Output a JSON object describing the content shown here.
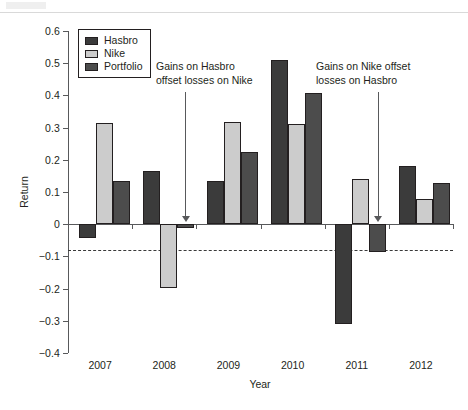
{
  "chart_data": {
    "type": "bar",
    "title": "",
    "xlabel": "Year",
    "ylabel": "Return",
    "categories": [
      "2007",
      "2008",
      "2009",
      "2010",
      "2011",
      "2012"
    ],
    "series": [
      {
        "name": "Hasbro",
        "color": "#3b3b3b",
        "values": [
          -0.043,
          0.166,
          0.133,
          0.51,
          -0.31,
          0.18
        ]
      },
      {
        "name": "Nike",
        "color": "#cccccc",
        "values": [
          0.314,
          -0.198,
          0.317,
          0.311,
          0.141,
          0.079
        ]
      },
      {
        "name": "Portfolio",
        "color": "#4c4c4c",
        "values": [
          0.135,
          -0.013,
          0.224,
          0.408,
          -0.086,
          0.129
        ]
      }
    ],
    "ylim": [
      -0.4,
      0.6
    ],
    "ytick_values": [
      0.6,
      0.5,
      0.4,
      0.3,
      0.2,
      0.1,
      0,
      -0.1,
      -0.2,
      -0.3,
      -0.4
    ],
    "ytick_labels": [
      "0.6",
      "0.5",
      "0.4",
      "0.3",
      "0.2",
      "0.1",
      "0",
      "−0.1",
      "−0.2",
      "−0.3",
      "−0.4"
    ],
    "grid": false,
    "legend_position": "top-left-inside",
    "reference_line": {
      "value": -0.08,
      "style": "dashed",
      "color": "#3a3a3a"
    },
    "annotations": [
      {
        "text": "Gains on Hasbro\noffset losses on Nike",
        "target_category": "2008",
        "target_series": "Portfolio",
        "target_value": -0.013
      },
      {
        "text": "Gains on Nike offset\nlosses on Hasbro",
        "target_category": "2011",
        "target_series": "Portfolio",
        "target_value": -0.086
      }
    ]
  },
  "legend": {
    "items": [
      {
        "label": "Hasbro"
      },
      {
        "label": "Nike"
      },
      {
        "label": "Portfolio"
      }
    ]
  },
  "axes": {
    "y_title": "Return",
    "x_title": "Year"
  }
}
